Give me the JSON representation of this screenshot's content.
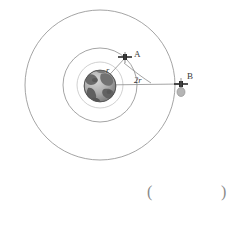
{
  "figure": {
    "kind": "physics-orbit-diagram",
    "canvas": {
      "width": 241,
      "height": 213,
      "background": "#ffffff"
    },
    "center": {
      "x": 100,
      "y": 85
    },
    "earth": {
      "name": "earth-globe",
      "cx": 100,
      "cy": 86,
      "r": 16,
      "palette": {
        "ocean_light": "#cfcfcf",
        "ocean_dark": "#8f8f8f",
        "land": "#6d6d6d",
        "land_dark": "#4a4a4a",
        "outline": "#555555"
      }
    },
    "orbits": [
      {
        "name": "orbit-inner-guide",
        "r": 23,
        "stroke": "#b9b9b9",
        "stroke_width": 0.7
      },
      {
        "name": "orbit-satellite-a",
        "r": 37,
        "stroke": "#8d8d8d",
        "stroke_width": 0.8
      },
      {
        "name": "orbit-satellite-b",
        "r": 75,
        "stroke": "#8d8d8d",
        "stroke_width": 0.8
      }
    ],
    "satellites": [
      {
        "id": "A",
        "name": "satellite-a",
        "label": "A",
        "x": 125,
        "y": 57,
        "label_x": 134,
        "label_y": 54,
        "marker": "cross",
        "color": "#2b2b2b"
      },
      {
        "id": "B",
        "name": "satellite-b",
        "label": "B",
        "x": 181,
        "y": 84,
        "label_x": 188,
        "label_y": 75,
        "marker": "cross",
        "color": "#2b2b2b"
      }
    ],
    "radii": [
      {
        "name": "radius-line-a",
        "label": "r",
        "from": {
          "x": 100,
          "y": 85
        },
        "to": {
          "x": 125,
          "y": 58
        },
        "label_x": 107,
        "label_y": 71,
        "italic": true,
        "stroke": "#8d8d8d"
      },
      {
        "name": "radius-line-b",
        "label": "2r",
        "from": {
          "x": 100,
          "y": 85
        },
        "to": {
          "x": 181,
          "y": 84
        },
        "label_x": 134,
        "label_y": 81,
        "italic": true,
        "stroke": "#8d8d8d"
      }
    ],
    "angle_arc": {
      "name": "angle-arc",
      "from": {
        "x": 124,
        "y": 62
      },
      "to": {
        "x": 151,
        "y": 83
      },
      "stroke": "#8d8d8d"
    },
    "stroke_color": "#8d8d8d",
    "text_color": "#3a3a3a"
  },
  "answer": {
    "left_paren": "(",
    "right_paren": ")",
    "value": ""
  }
}
